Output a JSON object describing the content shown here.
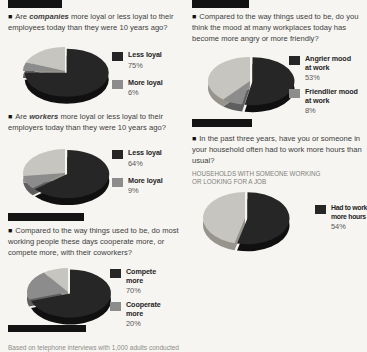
{
  "ui": {
    "bullet": "■"
  },
  "colors": {
    "pie_dark": "#262626",
    "pie_medium": "#8c8c8c",
    "pie_light": "#c7c5c0",
    "pie_dark_side": "#101010",
    "pie_medium_side": "#5e5e5e",
    "pie_light_side": "#96948d",
    "bar": "#131313",
    "text": "#3d3d3d",
    "muted": "#807f7a"
  },
  "caption": "Based on telephone interviews with 1,000 adults conducted",
  "chart_data": [
    {
      "type": "pie",
      "question_prefix": "Are ",
      "question_emph": "companies",
      "question_rest": " more loyal or less loyal to their employees today than they were 10 years ago?",
      "slices": [
        {
          "label": "Less loyal",
          "value": 75,
          "color": "dark"
        },
        {
          "label": "More loyal",
          "value": 6,
          "color": "medium"
        },
        {
          "label": "unlabeled",
          "value": 19,
          "color": "light"
        }
      ],
      "legend": [
        {
          "label": "Less loyal",
          "label2": "",
          "pct": "75%",
          "swatch": "dark"
        },
        {
          "label": "More loyal",
          "label2": "",
          "pct": "6%",
          "swatch": "medium"
        }
      ]
    },
    {
      "type": "pie",
      "question_prefix": "Are ",
      "question_emph": "workers",
      "question_rest": " more loyal or less loyal to their employers today than they were 10 years ago?",
      "slices": [
        {
          "label": "Less loyal",
          "value": 64,
          "color": "dark"
        },
        {
          "label": "More loyal",
          "value": 9,
          "color": "medium"
        },
        {
          "label": "unlabeled",
          "value": 27,
          "color": "light"
        }
      ],
      "legend": [
        {
          "label": "Less loyal",
          "label2": "",
          "pct": "64%",
          "swatch": "dark"
        },
        {
          "label": "More loyal",
          "label2": "",
          "pct": "9%",
          "swatch": "medium"
        }
      ]
    },
    {
      "type": "pie",
      "question_prefix": "Compared to the way things used to be, do most working people these days cooperate more, or compete more, with their coworkers?",
      "question_emph": "",
      "question_rest": "",
      "slices": [
        {
          "label": "Compete more",
          "value": 70,
          "color": "dark"
        },
        {
          "label": "Cooperate more",
          "value": 20,
          "color": "medium"
        },
        {
          "label": "unlabeled",
          "value": 10,
          "color": "light"
        }
      ],
      "legend": [
        {
          "label": "Compete",
          "label2": "more",
          "pct": "70%",
          "swatch": "dark"
        },
        {
          "label": "Cooperate",
          "label2": "more",
          "pct": "20%",
          "swatch": "medium"
        }
      ]
    },
    {
      "type": "pie",
      "question_prefix": "Compared to the way things used to be, do you think the mood at many workplaces today has become more angry or more friendly?",
      "question_emph": "",
      "question_rest": "",
      "slices": [
        {
          "label": "Angrier mood at work",
          "value": 53,
          "color": "dark"
        },
        {
          "label": "Friendlier mood at work",
          "value": 8,
          "color": "medium"
        },
        {
          "label": "unlabeled",
          "value": 39,
          "color": "light"
        }
      ],
      "legend": [
        {
          "label": "Angrier mood",
          "label2": "at work",
          "pct": "53%",
          "swatch": "dark"
        },
        {
          "label": "Friendlier mood",
          "label2": "at work",
          "pct": "8%",
          "swatch": "medium"
        }
      ]
    },
    {
      "type": "pie",
      "question_prefix": "In the past three years, have you or someone in your household often had to work more hours than usual?",
      "question_emph": "",
      "question_rest": "",
      "subheading": "HOUSEHOLDS WITH SOMEONE WORKING OR LOOKING FOR A JOB",
      "slices": [
        {
          "label": "Had to work more hours",
          "value": 54,
          "color": "dark"
        },
        {
          "label": "unlabeled",
          "value": 46,
          "color": "light"
        }
      ],
      "legend": [
        {
          "label": "Had to work",
          "label2": "more hours",
          "pct": "54%",
          "swatch": "dark"
        }
      ]
    }
  ]
}
